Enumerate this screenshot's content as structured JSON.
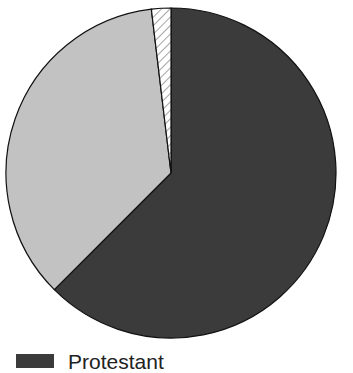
{
  "chart_data": {
    "type": "pie",
    "title": "",
    "start_angle_deg": 0,
    "direction": "clockwise",
    "slices": [
      {
        "label": "Protestant",
        "value": 62.5,
        "color": "#3b3b3b",
        "pattern": "solid"
      },
      {
        "label": "",
        "value": 35.6,
        "color": "#c2c2c2",
        "pattern": "solid"
      },
      {
        "label": "",
        "value": 1.9,
        "color": "#ffffff",
        "pattern": "hatch"
      }
    ],
    "legend": {
      "position": "bottom-left",
      "entries": [
        {
          "label": "Protestant",
          "color": "#3b3b3b"
        }
      ]
    }
  },
  "legend": {
    "items": [
      {
        "label": "Protestant"
      }
    ]
  }
}
